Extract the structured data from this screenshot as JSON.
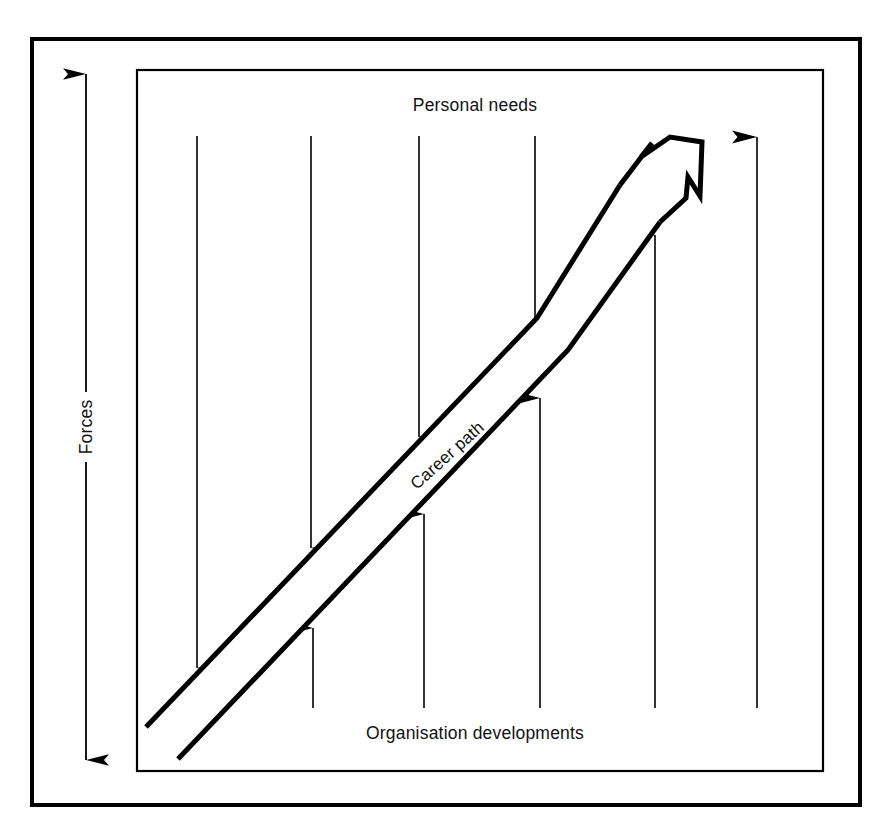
{
  "figure": {
    "background_color": "#ffffff",
    "ink_color": "#000000",
    "outer_frame": {
      "x": 32,
      "y": 39,
      "width": 828,
      "height": 766,
      "stroke_width": 4
    },
    "inner_frame": {
      "x": 137,
      "y": 70,
      "width": 686,
      "height": 701,
      "stroke_width": 2.2
    }
  },
  "labels": {
    "top": "Personal needs",
    "bottom": "Organisation developments",
    "left_axis": "Forces",
    "band": "Career path"
  },
  "axis": {
    "name": "forces-axis",
    "orientation": "vertical",
    "double_headed": true,
    "x": 86,
    "y_top": 72,
    "y_bottom": 762,
    "label_gap": {
      "y_start": 392,
      "y_end": 462
    }
  },
  "career_path": {
    "name": "career-path-arrow",
    "label": "Career path",
    "label_position": {
      "x": 447,
      "y": 455
    },
    "label_rotation_deg": -42,
    "upper_line": [
      {
        "x": 146,
        "y": 727
      },
      {
        "x": 537,
        "y": 318
      },
      {
        "x": 620,
        "y": 185
      }
    ],
    "lower_line": [
      {
        "x": 178,
        "y": 759
      },
      {
        "x": 568,
        "y": 350
      },
      {
        "x": 660,
        "y": 222
      }
    ],
    "arrow_head": [
      {
        "x": 620,
        "y": 185
      },
      {
        "x": 652,
        "y": 143
      },
      {
        "x": 641,
        "y": 157
      },
      {
        "x": 670,
        "y": 137
      },
      {
        "x": 702,
        "y": 142
      },
      {
        "x": 700,
        "y": 196
      },
      {
        "x": 688,
        "y": 177
      },
      {
        "x": 686,
        "y": 198
      },
      {
        "x": 660,
        "y": 222
      }
    ],
    "stroke_width": 5
  },
  "force_arrows": {
    "downward": {
      "name": "personal-needs-force-arrows",
      "direction": "down",
      "meaning": "Personal needs pressing down onto the career path",
      "y_start": 136,
      "count": 4,
      "arrows": [
        {
          "x": 197,
          "y_tip": 668
        },
        {
          "x": 311,
          "y_tip": 548
        },
        {
          "x": 419,
          "y_tip": 437
        },
        {
          "x": 535,
          "y_tip": 321
        }
      ]
    },
    "upward": {
      "name": "organisation-developments-force-arrows",
      "direction": "up",
      "meaning": "Organisation developments pushing up onto the career path",
      "y_start": 708,
      "count": 4,
      "arrows": [
        {
          "x": 313,
          "y_tip": 628
        },
        {
          "x": 424,
          "y_tip": 514
        },
        {
          "x": 540,
          "y_tip": 398
        },
        {
          "x": 655,
          "y_tip": 235
        }
      ]
    },
    "free_standing": {
      "name": "free-force-arrow",
      "direction": "up",
      "arrows": [
        {
          "x": 757,
          "y_tip": 137,
          "y_start": 708
        }
      ]
    },
    "stroke_width": 1.6,
    "head_length": 26,
    "head_width": 13
  },
  "top_label_position": {
    "x": 475,
    "y": 111
  },
  "bottom_label_position": {
    "x": 475,
    "y": 739
  }
}
